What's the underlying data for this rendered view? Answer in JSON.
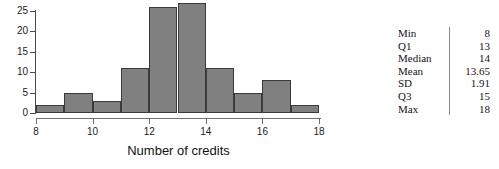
{
  "chart_data": {
    "type": "bar",
    "title": "",
    "xlabel": "Number of credits",
    "ylabel": "",
    "categories": [
      "8-9",
      "9-10",
      "10-11",
      "11-12",
      "12-13",
      "13-14",
      "14-15",
      "15-16",
      "16-17",
      "17-18"
    ],
    "bin_edges": [
      8,
      9,
      10,
      11,
      12,
      13,
      14,
      15,
      16,
      17,
      18
    ],
    "values": [
      2,
      5,
      3,
      11,
      26,
      27,
      11,
      5,
      8,
      2
    ],
    "xlim": [
      8,
      18
    ],
    "ylim": [
      0,
      25
    ],
    "x_ticks": [
      8,
      10,
      12,
      14,
      16,
      18
    ],
    "x_tick_labels": [
      "8",
      "10",
      "12",
      "14",
      "16",
      "18"
    ],
    "y_ticks": [
      0,
      5,
      10,
      15,
      20,
      25
    ],
    "y_tick_labels": [
      "0",
      "5",
      "10",
      "15",
      "20",
      "25"
    ],
    "grid": false,
    "legend": false,
    "bar_color": "#808080",
    "bar_edge_color": "#3b3b3b"
  },
  "stats": {
    "rows": [
      {
        "label": "Min",
        "value": "8"
      },
      {
        "label": "Q1",
        "value": "13"
      },
      {
        "label": "Median",
        "value": "14"
      },
      {
        "label": "Mean",
        "value": "13.65"
      },
      {
        "label": "SD",
        "value": "1.91"
      },
      {
        "label": "Q3",
        "value": "15"
      },
      {
        "label": "Max",
        "value": "18"
      }
    ]
  }
}
